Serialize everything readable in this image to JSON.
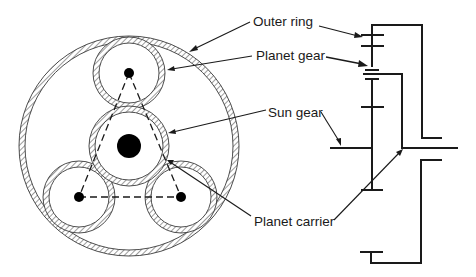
{
  "diagram": {
    "labels": {
      "outer_ring": "Outer ring",
      "planet_gear": "Planet gear",
      "sun_gear": "Sun gear",
      "planet_carrier": "Planet carrier"
    },
    "colors": {
      "line": "#1a1a1a",
      "hatch": "#3a3a3a",
      "background": "#ffffff"
    },
    "front_view": {
      "outer_ring": {
        "cx": 129,
        "cy": 146,
        "r_outer": 110,
        "r_inner": 104
      },
      "sun_gear": {
        "cx": 129,
        "cy": 146,
        "r_outer": 40,
        "r_inner": 34,
        "hub_r": 12
      },
      "planets": [
        {
          "name": "top",
          "cx": 129,
          "cy": 73,
          "r_outer": 36,
          "r_inner": 30,
          "pin_r": 5
        },
        {
          "name": "bottom-left",
          "cx": 79,
          "cy": 197,
          "r_outer": 36,
          "r_inner": 30,
          "pin_r": 5
        },
        {
          "name": "bottom-right",
          "cx": 181,
          "cy": 197,
          "r_outer": 36,
          "r_inner": 30,
          "pin_r": 5
        }
      ],
      "carrier_triangle": "dashed lines connecting planet centers"
    },
    "side_view": {
      "description": "Schematic stick diagram of sun gear shaft, planet carrier and outer ring"
    }
  }
}
